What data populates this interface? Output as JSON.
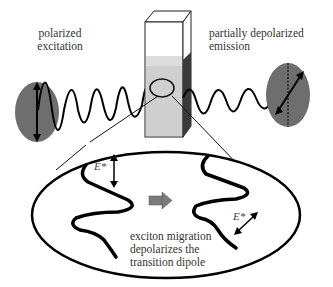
{
  "diagram": {
    "labels": {
      "excitation_line1": "polarized",
      "excitation_line2": "excitation",
      "emission_line1": "partially depolarized",
      "emission_line2": "emission",
      "caption_line1": "exciton migration",
      "caption_line2": "depolarizes the",
      "caption_line3": "transition dipole",
      "excited_state_left": "E*",
      "excited_state_right": "E*"
    },
    "elements": {
      "left_ellipse": "polarized excitation light (vertical dipole)",
      "right_ellipse": "depolarized emission light (tilted dipole)",
      "cuvette": "sample cuvette",
      "inset": "magnified polymer chain view",
      "transition_arrow": "gray right arrow"
    },
    "colors": {
      "ellipse_fill": "#6e6e6e",
      "cuvette_liquid": "#cfcfcf",
      "cuvette_dark_side": "#3a3a3a",
      "arrow_fill": "#7a7a7a",
      "line": "#111111"
    }
  }
}
